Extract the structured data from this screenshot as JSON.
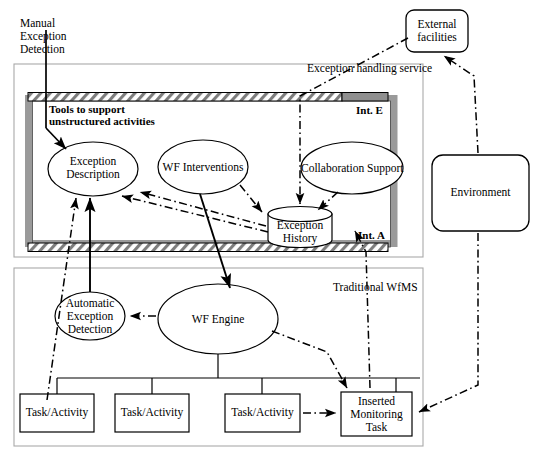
{
  "diagram": {
    "type": "block-diagram",
    "colors": {
      "stroke": "#000000",
      "frame_gray": "#8c8c8c",
      "outer_box": "#b3b3b3",
      "hatch_fill": "#ffffff",
      "background": "#ffffff"
    }
  },
  "labels": {
    "manual_exception_detection": "Manual\nException\nDetection",
    "exception_handling_service": "Exception handling service",
    "tools_to_support": "Tools to support\nunstructured activities",
    "int_e": "Int. E",
    "int_a": "Int. A",
    "traditional_wfms": "Traditional WfMS"
  },
  "nodes": {
    "exception_description": {
      "label": "Exception\nDescription",
      "shape": "ellipse"
    },
    "wf_interventions": {
      "label": "WF Interventions",
      "shape": "ellipse"
    },
    "collaboration_support": {
      "label": "Collaboration Support",
      "shape": "ellipse"
    },
    "exception_history": {
      "label": "Exception\nHistory",
      "shape": "cylinder"
    },
    "automatic_exception_detection": {
      "label": "Automatic\nException\nDetection",
      "shape": "ellipse"
    },
    "wf_engine": {
      "label": "WF Engine",
      "shape": "ellipse"
    },
    "external_facilities": {
      "label": "External\nfacilities",
      "shape": "rounded-rect"
    },
    "environment": {
      "label": "Environment",
      "shape": "rounded-rect"
    },
    "task_activity_1": {
      "label": "Task/Activity",
      "shape": "rect"
    },
    "task_activity_2": {
      "label": "Task/Activity",
      "shape": "rect"
    },
    "task_activity_3": {
      "label": "Task/Activity",
      "shape": "rect"
    },
    "inserted_monitoring_task": {
      "label": "Inserted\nMonitoring\nTask",
      "shape": "rect"
    }
  },
  "edges": [
    {
      "from": "manual_exception_detection",
      "to": "exception_description",
      "style": "solid-arrow"
    },
    {
      "from": "automatic_exception_detection",
      "to": "exception_description",
      "style": "solid-arrow"
    },
    {
      "from": "wf_interventions",
      "to": "wf_engine",
      "style": "solid-arrow"
    },
    {
      "from": "wf_interventions",
      "to": "exception_history",
      "style": "dashdot-arrow"
    },
    {
      "from": "collaboration_support",
      "to": "exception_history",
      "style": "dashdot-arrow"
    },
    {
      "from": "external_facilities",
      "to": "exception_history",
      "style": "dashdot-arrow"
    },
    {
      "from": "exception_history",
      "to": "exception_description",
      "style": "dashdot-arrow"
    },
    {
      "from": "wf_engine",
      "to": "automatic_exception_detection",
      "style": "dashdot-arrow"
    },
    {
      "from": "wf_engine",
      "to": "inserted_monitoring_task",
      "style": "dashdot-arrow"
    },
    {
      "from": "task_activity_3",
      "to": "inserted_monitoring_task",
      "style": "dashdot-arrow"
    },
    {
      "from": "environment",
      "to": "external_facilities",
      "style": "dashdot-arrow"
    },
    {
      "from": "environment",
      "to": "inserted_monitoring_task",
      "style": "dashdot-arrow"
    },
    {
      "from": "inserted_monitoring_task",
      "to": "exception_history",
      "style": "dashdot-arrow"
    },
    {
      "from": "task_activity_1",
      "to": "exception_description",
      "style": "dashdot-arrow"
    },
    {
      "from": "wf_engine",
      "to": "task_activity_1",
      "style": "solid"
    },
    {
      "from": "wf_engine",
      "to": "task_activity_2",
      "style": "solid"
    },
    {
      "from": "wf_engine",
      "to": "task_activity_3",
      "style": "solid"
    },
    {
      "from": "wf_engine",
      "to": "inserted_monitoring_task",
      "style": "solid"
    }
  ]
}
